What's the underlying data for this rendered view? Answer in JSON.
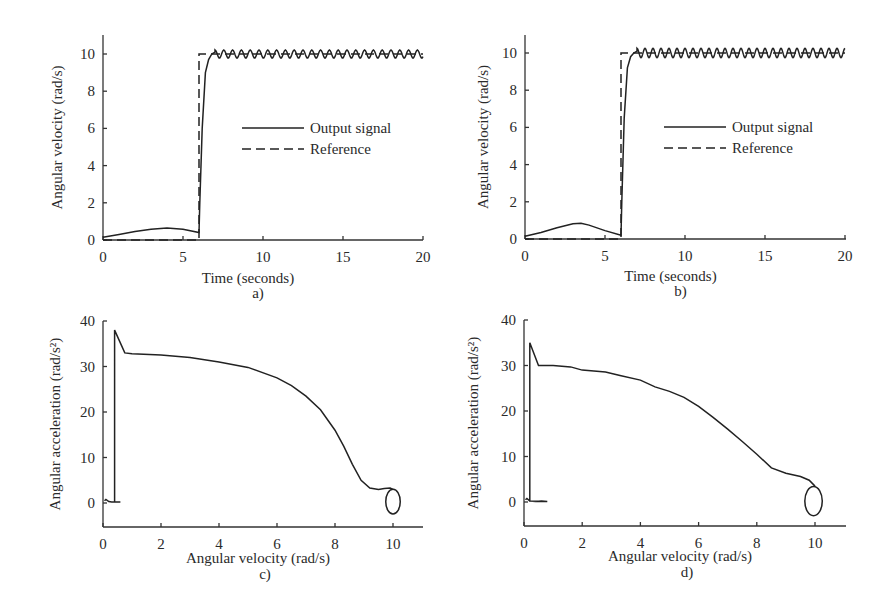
{
  "chart_data": [
    {
      "id": "a",
      "type": "line",
      "caption": "a)",
      "xlabel": "Time (seconds)",
      "ylabel": "Angular velocity (rad/s)",
      "xlim": [
        0,
        20
      ],
      "ylim": [
        0,
        11
      ],
      "xticks": [
        0,
        5,
        10,
        15,
        20
      ],
      "yticks": [
        0,
        2,
        4,
        6,
        8,
        10
      ],
      "grid": false,
      "legend": {
        "placement": "center-right",
        "entries": [
          "Output signal",
          "Reference"
        ]
      },
      "series": [
        {
          "name": "Output signal",
          "style": "solid",
          "x": [
            0,
            1,
            2,
            3,
            4,
            5,
            6,
            6.05,
            6.2,
            6.4,
            6.6,
            6.8,
            7.0
          ],
          "y": [
            0.15,
            0.3,
            0.45,
            0.58,
            0.65,
            0.58,
            0.4,
            2.0,
            6.0,
            9.0,
            9.7,
            10.0,
            10.1
          ],
          "steady_state": {
            "from": 7.0,
            "to": 20,
            "mean": 10.0,
            "amplitude": 0.22,
            "period": 0.55
          }
        },
        {
          "name": "Reference",
          "style": "dashed",
          "x": [
            0,
            6,
            6,
            20
          ],
          "y": [
            0,
            0,
            10,
            10
          ]
        }
      ]
    },
    {
      "id": "b",
      "type": "line",
      "caption": "b)",
      "xlabel": "Time (seconds)",
      "ylabel": "Angular velocity (rad/s)",
      "xlim": [
        0,
        20
      ],
      "ylim": [
        0,
        11
      ],
      "xticks": [
        0,
        5,
        10,
        15,
        20
      ],
      "yticks": [
        0,
        2,
        4,
        6,
        8,
        10
      ],
      "grid": false,
      "legend": {
        "placement": "center-right",
        "entries": [
          "Output signal",
          "Reference"
        ]
      },
      "series": [
        {
          "name": "Output signal",
          "style": "solid",
          "x": [
            0,
            1,
            2,
            3,
            3.5,
            4,
            5,
            6,
            6.05,
            6.2,
            6.4,
            6.6,
            6.8,
            7.0
          ],
          "y": [
            0.15,
            0.35,
            0.6,
            0.82,
            0.85,
            0.75,
            0.45,
            0.2,
            2.0,
            6.5,
            9.2,
            9.8,
            10.0,
            10.1
          ],
          "steady_state": {
            "from": 7.0,
            "to": 20,
            "mean": 10.0,
            "amplitude": 0.25,
            "period": 0.5
          }
        },
        {
          "name": "Reference",
          "style": "dashed",
          "x": [
            0,
            6,
            6,
            20
          ],
          "y": [
            0,
            0,
            10,
            10
          ]
        }
      ]
    },
    {
      "id": "c",
      "type": "line",
      "caption": "c)",
      "xlabel": "Angular velocity (rad/s)",
      "ylabel": "Angular acceleration (rad/s²)",
      "xlim": [
        0,
        11
      ],
      "ylim": [
        -5,
        40
      ],
      "xticks": [
        0,
        2,
        4,
        6,
        8,
        10
      ],
      "yticks": [
        0,
        10,
        20,
        30,
        40
      ],
      "grid": false,
      "series": [
        {
          "name": "phase trajectory",
          "style": "solid",
          "x": [
            0.05,
            0.1,
            0.2,
            0.3,
            0.4,
            0.5,
            0.6,
            0.4,
            0.4,
            0.75,
            1,
            2,
            3,
            4,
            5,
            6,
            6.5,
            7,
            7.5,
            8,
            8.3,
            8.6,
            8.9,
            9.2,
            9.5,
            9.7,
            9.9,
            10.0
          ],
          "y": [
            0.5,
            0.8,
            0.3,
            0.2,
            0.2,
            0.2,
            0.2,
            0.2,
            38,
            33,
            32.8,
            32.5,
            32,
            31,
            29.8,
            27.5,
            25.8,
            23.5,
            20.5,
            16,
            12.5,
            8.5,
            5,
            3.3,
            3.0,
            3.2,
            3.3,
            3.0
          ]
        },
        {
          "name": "limit cycle",
          "style": "solid",
          "center": [
            10.0,
            0.3
          ],
          "radius_x": 0.25,
          "radius_y": 2.7
        }
      ]
    },
    {
      "id": "d",
      "type": "line",
      "caption": "d)",
      "xlabel": "Angular velocity (rad/s)",
      "ylabel": "Angular acceleration (rad/s²)",
      "xlim": [
        0,
        11
      ],
      "ylim": [
        -5,
        40
      ],
      "xticks": [
        0,
        2,
        4,
        6,
        8,
        10
      ],
      "yticks": [
        0,
        10,
        20,
        30,
        40
      ],
      "grid": false,
      "series": [
        {
          "name": "phase trajectory",
          "style": "solid",
          "x": [
            0.05,
            0.1,
            0.2,
            0.4,
            0.6,
            0.8,
            0.2,
            0.2,
            0.5,
            1,
            1.6,
            2,
            2.8,
            3.3,
            4,
            4.5,
            5,
            5.5,
            6,
            6.5,
            7,
            7.5,
            8,
            8.5,
            9,
            9.5,
            9.8,
            10.0
          ],
          "y": [
            0.5,
            0.8,
            0.2,
            0.1,
            0.2,
            0.1,
            0.2,
            35,
            30,
            30,
            29.7,
            29,
            28.6,
            27.8,
            26.8,
            25.3,
            24.3,
            23,
            21,
            18.6,
            16,
            13.3,
            10.5,
            7.5,
            6.3,
            5.6,
            4.8,
            3.5
          ]
        },
        {
          "name": "limit cycle",
          "style": "solid",
          "center": [
            9.95,
            0.2
          ],
          "radius_x": 0.3,
          "radius_y": 3.2
        }
      ]
    }
  ]
}
